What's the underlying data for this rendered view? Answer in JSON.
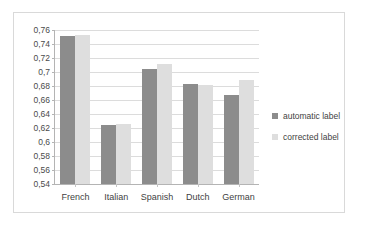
{
  "chart_data": {
    "type": "bar",
    "title": "",
    "xlabel": "",
    "ylabel": "",
    "categories": [
      "French",
      "Italian",
      "Spanish",
      "Dutch",
      "German"
    ],
    "series": [
      {
        "name": "automatic label",
        "color": "#8c8c8c",
        "values": [
          0.751,
          0.624,
          0.705,
          0.683,
          0.667
        ]
      },
      {
        "name": "corrected label",
        "color": "#dedede",
        "values": [
          0.753,
          0.626,
          0.711,
          0.681,
          0.688
        ]
      }
    ],
    "ylim": [
      0.54,
      0.76
    ],
    "ytick_step": 0.02,
    "ytick_labels": [
      "0,76",
      "0,74",
      "0,72",
      "0,7",
      "0,68",
      "0,66",
      "0,64",
      "0,62",
      "0,6",
      "0,58",
      "0,56",
      "0,54"
    ],
    "ytick_values": [
      0.76,
      0.74,
      0.72,
      0.7,
      0.68,
      0.66,
      0.64,
      0.62,
      0.6,
      0.58,
      0.56,
      0.54
    ],
    "decimal_separator": ",",
    "grid": true,
    "legend_position": "right"
  },
  "legend": {
    "items": [
      {
        "label": "automatic label"
      },
      {
        "label": "corrected label"
      }
    ]
  },
  "colors": {
    "series_automatic": "#8c8c8c",
    "series_corrected": "#dedede",
    "gridline": "#dcdcdc",
    "axis": "#b4b4b4",
    "frame": "#d9d9d9",
    "background": "#ffffff",
    "text": "#3f3f3f"
  }
}
